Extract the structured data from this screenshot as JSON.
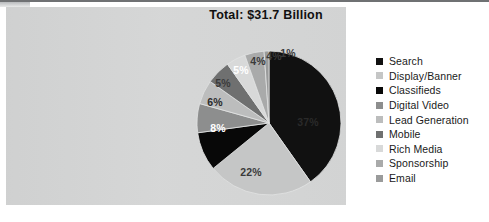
{
  "chart_data": {
    "type": "pie",
    "title": "Total: $31.7 Billion",
    "categories": [
      "Search",
      "Display/Banner",
      "Classifieds",
      "Digital Video",
      "Lead Generation",
      "Mobile",
      "Rich Media",
      "Sponsorship",
      "Email"
    ],
    "values": [
      37,
      22,
      8,
      6,
      5,
      5,
      4,
      4,
      1
    ],
    "labels": [
      "37%",
      "22%",
      "8%",
      "6%",
      "5%",
      "5%",
      "4%",
      "4%",
      "1%"
    ],
    "colors": [
      "#111111",
      "#c5c6c6",
      "#080808",
      "#8d8e8e",
      "#bcbdbd",
      "#6f7070",
      "#d8d9d9",
      "#a9aaaa",
      "#9a9b9b"
    ],
    "label_colors": [
      "#2a2a2a",
      "#3a3a3a",
      "#ffffff",
      "#2b2b2b",
      "#3b3b3b",
      "#ffffff",
      "#3a3a3a",
      "#3a3a3a",
      "#3a3a3a"
    ],
    "label_positions": [
      {
        "x": 112,
        "y": 72
      },
      {
        "x": 55,
        "y": 122
      },
      {
        "x": 22,
        "y": 78
      },
      {
        "x": 19,
        "y": 52
      },
      {
        "x": 27,
        "y": 33
      },
      {
        "x": 45,
        "y": 20
      },
      {
        "x": 62,
        "y": 11
      },
      {
        "x": 78,
        "y": 6
      },
      {
        "x": 92,
        "y": 3
      }
    ],
    "legend_position": "right",
    "start_angle": 0,
    "direction": "clockwise",
    "xlabel": "",
    "ylabel": ""
  },
  "legend": {
    "items": [
      {
        "label": "Search",
        "color": "#111111"
      },
      {
        "label": "Display/Banner",
        "color": "#c5c6c6"
      },
      {
        "label": "Classifieds",
        "color": "#080808"
      },
      {
        "label": "Digital Video",
        "color": "#8d8e8e"
      },
      {
        "label": "Lead Generation",
        "color": "#bcbdbd"
      },
      {
        "label": "Mobile",
        "color": "#6f7070"
      },
      {
        "label": "Rich Media",
        "color": "#d8d9d9"
      },
      {
        "label": "Sponsorship",
        "color": "#a9aaaa"
      },
      {
        "label": "Email",
        "color": "#9a9b9b"
      }
    ]
  }
}
